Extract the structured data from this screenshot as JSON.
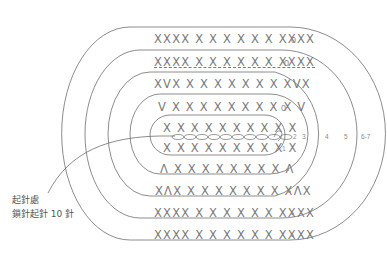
{
  "diagram": {
    "rows_top": [
      {
        "id": "row7-top",
        "text": "XXXX X X X X X X XXXX",
        "end_mark": "0"
      },
      {
        "id": "row6-top",
        "text": "XXXX X X X X X X XXXX",
        "end_mark": "0",
        "underlined": true
      },
      {
        "id": "row5-top",
        "text": "XVX X X X X X X X XVX",
        "end_mark": ""
      },
      {
        "id": "row4-top",
        "text": "V X X X X X X X X X V",
        "end_mark": "0"
      },
      {
        "id": "row3-top",
        "text": "X X X X X X X X X X",
        "end_mark": ""
      }
    ],
    "foundation_chain": {
      "count": 11
    },
    "rows_bottom": [
      {
        "id": "row1-bottom",
        "text": "X X X X X X X X X X",
        "end_mark": ""
      },
      {
        "id": "row3-bottom",
        "text": "Λ X X X X X X X X Λ",
        "end_mark": "•"
      },
      {
        "id": "row4-bottom",
        "text": "XΛX X X X X X X X XΛX",
        "end_mark": "•"
      },
      {
        "id": "row5-bottom",
        "text": "XXXX X X X X X X XXXX",
        "end_mark": "•"
      },
      {
        "id": "row6-bottom",
        "text": "XXXX X X X X X X XXXX",
        "end_mark": "•"
      }
    ],
    "round_numbers": [
      "1",
      "2",
      "3",
      "4",
      "5",
      "6-7"
    ],
    "start_label": {
      "line1": "起針處",
      "line2": "鎖針起針 10 針"
    },
    "colors": {
      "line": "#6f6f6f",
      "text": "#7a7a7a"
    }
  }
}
